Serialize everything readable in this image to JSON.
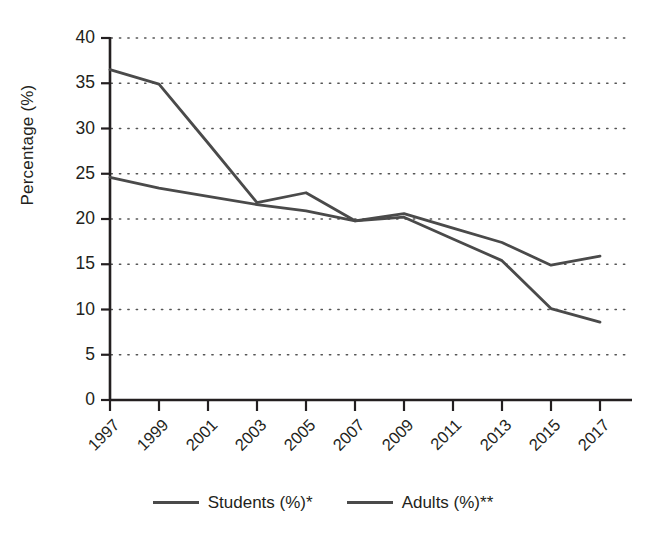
{
  "chart_data": {
    "type": "line",
    "title": "",
    "xlabel": "",
    "ylabel": "Percentage (%)",
    "categories": [
      "1997",
      "1999",
      "2001",
      "2003",
      "2005",
      "2007",
      "2009",
      "2011",
      "2013",
      "2015",
      "2017"
    ],
    "x": [
      1997,
      1999,
      2001,
      2003,
      2005,
      2007,
      2009,
      2011,
      2013,
      2015,
      2017
    ],
    "ylim": [
      0,
      40
    ],
    "xlim": [
      1997,
      2017
    ],
    "yticks": [
      0,
      5,
      10,
      15,
      20,
      25,
      30,
      35,
      40
    ],
    "ytick_labels": [
      "0",
      "5",
      "10",
      "15",
      "20",
      "25",
      "30",
      "35",
      "40"
    ],
    "grid": "horizontal-dotted",
    "legend_position": "bottom-center",
    "series": [
      {
        "name": "Students (%)*",
        "color": "#4a4a4a",
        "values": [
          36.5,
          34.9,
          28.4,
          21.8,
          22.9,
          19.8,
          20.2,
          17.8,
          15.4,
          10.1,
          8.6
        ]
      },
      {
        "name": "Adults (%)**",
        "color": "#4a4a4a",
        "values": [
          24.6,
          23.4,
          22.5,
          21.6,
          20.9,
          19.8,
          20.6,
          19.0,
          17.4,
          14.9,
          15.9
        ]
      }
    ]
  },
  "axes": {
    "y_title": "Percentage (%)"
  },
  "legend": {
    "items": [
      {
        "label": "Students (%)*"
      },
      {
        "label": "Adults (%)**"
      }
    ]
  }
}
